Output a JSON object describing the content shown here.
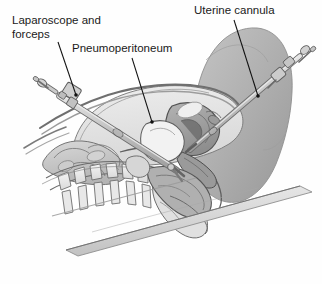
{
  "figure": {
    "view": "lateral sagittal section of female pelvis",
    "background_color": "#fefefe",
    "border": "none",
    "width": 322,
    "height": 284
  },
  "labels": [
    {
      "id": "laparoscope-and-forceps",
      "lines": [
        "Laparoscope and",
        "forceps"
      ],
      "line1": "Laparoscope and",
      "line2": "forceps",
      "text_x": 12,
      "text_y": 24,
      "line_height": 14,
      "leader": {
        "x1": 58,
        "y1": 42,
        "x2": 76,
        "y2": 95
      },
      "dot": {
        "cx": 76,
        "cy": 95,
        "r": 1.8
      }
    },
    {
      "id": "pneumoperitoneum",
      "lines": [
        "Pneumoperitoneum"
      ],
      "line1": "Pneumoperitoneum",
      "line2": "",
      "text_x": 72,
      "text_y": 52,
      "line_height": 14,
      "leader": {
        "x1": 132,
        "y1": 58,
        "x2": 152,
        "y2": 122
      },
      "dot": {
        "cx": 152,
        "cy": 122,
        "r": 1.8
      }
    },
    {
      "id": "uterine-cannula",
      "lines": [
        "Uterine cannula"
      ],
      "line1": "Uterine cannula",
      "line2": "",
      "text_x": 194,
      "text_y": 14,
      "line_height": 14,
      "leader": {
        "x1": 234,
        "y1": 20,
        "x2": 258,
        "y2": 96
      },
      "dot": {
        "cx": 258,
        "cy": 96,
        "r": 1.8
      }
    }
  ],
  "anatomy": [
    {
      "id": "torso-body-wall",
      "name": "Torso and abdominal wall",
      "color": "#d6d6d6"
    },
    {
      "id": "thigh-buttock",
      "name": "Thigh and buttock",
      "color": "#b2b2b2"
    },
    {
      "id": "pneumoperitoneum-space",
      "name": "Pneumoperitoneum (insufflated gas space)",
      "color": "#e2e2e2"
    },
    {
      "id": "abdominal-wall-lift",
      "name": "Lifted abdominal wall",
      "color": "#c9c9c9"
    },
    {
      "id": "small-bowel",
      "name": "Small bowel loops",
      "color": "#c4c4c4"
    },
    {
      "id": "vertebral-column",
      "name": "Lumbar vertebrae",
      "color": "#ececec"
    },
    {
      "id": "sacrum",
      "name": "Sacrum and coccyx",
      "color": "#e4e4e4"
    },
    {
      "id": "uterus",
      "name": "Uterus",
      "color": "#9e9e9e"
    },
    {
      "id": "bladder",
      "name": "Urinary bladder",
      "color": "#f0f0f0"
    },
    {
      "id": "rectum",
      "name": "Rectum",
      "color": "#a8a8a8"
    },
    {
      "id": "vagina",
      "name": "Vagina",
      "color": "#8c8c8c"
    },
    {
      "id": "operating-table",
      "name": "Operating table edge",
      "color": "#d2d2d2"
    }
  ],
  "instruments": [
    {
      "id": "laparoscope",
      "name": "Laparoscope with trocar and forceps",
      "shaft_color": "#bfbfbf",
      "outline_color": "#6b6b6b",
      "entry_point": "umbilical / lower abdominal wall"
    },
    {
      "id": "uterine-cannula",
      "name": "Uterine cannula",
      "shaft_color": "#c4c4c4",
      "outline_color": "#6b6b6b",
      "entry_point": "transvaginal into uterine cavity"
    }
  ],
  "colors": {
    "outline": "#5a5a5a",
    "dark_outline": "#3d3d3d",
    "text": "#1a1a1a",
    "leader": "#111111",
    "background": "#fefefe"
  }
}
